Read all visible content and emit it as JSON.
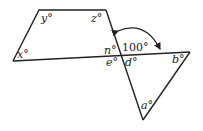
{
  "diagram": {
    "type": "geometry",
    "labels": {
      "x": "x°",
      "y": "y°",
      "z": "z°",
      "n": "n°",
      "e": "e°",
      "d": "d°",
      "b": "b°",
      "a": "a°",
      "angle_given": "100°"
    },
    "stroke_color": "#222222"
  }
}
